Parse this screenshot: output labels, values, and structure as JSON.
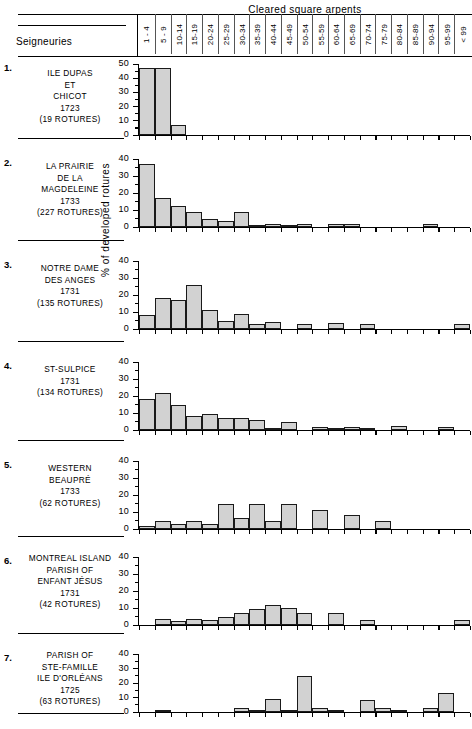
{
  "header": {
    "top_title": "Cleared square arpents",
    "row_label": "Seigneuries",
    "categories": [
      "1 - 4",
      "5 - 9",
      "10-14",
      "15-19",
      "20-24",
      "25-29",
      "30-34",
      "35-39",
      "40-44",
      "45-49",
      "50-54",
      "55-59",
      "60-64",
      "65-69",
      "70-74",
      "75-79",
      "80-84",
      "85-89",
      "90-94",
      "95-99",
      "< 99"
    ]
  },
  "axis": {
    "y_caption": "% of developed rotures",
    "ticks_50": [
      "50",
      "40",
      "30",
      "20",
      "10",
      "0"
    ],
    "ticks_40": [
      "40",
      "30",
      "20",
      "10",
      "0"
    ]
  },
  "chart_data": {
    "type": "bar",
    "title": "Cleared square arpents",
    "xlabel": "Cleared square arpents",
    "ylabel": "% of developed rotures",
    "grid": false,
    "legend": "none",
    "categories": [
      "1 - 4",
      "5 - 9",
      "10-14",
      "15-19",
      "20-24",
      "25-29",
      "30-34",
      "35-39",
      "40-44",
      "45-49",
      "50-54",
      "55-59",
      "60-64",
      "65-69",
      "70-74",
      "75-79",
      "80-84",
      "85-89",
      "90-94",
      "95-99",
      "< 99"
    ],
    "panels": [
      {
        "index": "1.",
        "name": [
          "ILE DUPAS",
          "ET",
          "CHICOT",
          "1723",
          "(19 ROTURES)"
        ],
        "seigneurie": "ILE DUPAS ET CHICOT",
        "year": "1723",
        "rotures": "(19 ROTURES)",
        "ylim": [
          0,
          50
        ],
        "yticks": [
          0,
          10,
          20,
          30,
          40,
          50
        ],
        "values": [
          47,
          47,
          7,
          0,
          0,
          0,
          0,
          0,
          0,
          0,
          0,
          0,
          0,
          0,
          0,
          0,
          0,
          0,
          0,
          0,
          0
        ]
      },
      {
        "index": "2.",
        "name": [
          "LA PRAIRIE",
          "DE LA",
          "MAGDELEINE",
          "1733",
          "(227 ROTURES)"
        ],
        "seigneurie": "LA PRAIRIE DE LA MAGDELEINE",
        "year": "1733",
        "rotures": "(227 ROTURES)",
        "ylim": [
          0,
          40
        ],
        "yticks": [
          0,
          10,
          20,
          30,
          40
        ],
        "values": [
          37,
          17,
          12.5,
          9,
          4.5,
          3.5,
          9,
          1,
          2,
          1,
          2,
          0,
          1.5,
          1.5,
          0,
          0,
          0,
          0,
          1.5,
          0,
          0
        ]
      },
      {
        "index": "3.",
        "name": [
          "NOTRE DAME",
          "DES ANGES",
          "1731",
          "(135 ROTURES)"
        ],
        "seigneurie": "NOTRE DAME DES ANGES",
        "year": "1731",
        "rotures": "(135 ROTURES)",
        "ylim": [
          0,
          40
        ],
        "yticks": [
          0,
          10,
          20,
          30,
          40
        ],
        "values": [
          8,
          18,
          17,
          26,
          11,
          5,
          9,
          3,
          4,
          0,
          3,
          0,
          3.5,
          0,
          3,
          0,
          0,
          0,
          0,
          0,
          3
        ]
      },
      {
        "index": "4.",
        "name": [
          "ST-SULPICE",
          "1731",
          "(134 ROTURES)"
        ],
        "seigneurie": "ST-SULPICE",
        "year": "1731",
        "rotures": "(134 ROTURES)",
        "ylim": [
          0,
          40
        ],
        "yticks": [
          0,
          10,
          20,
          30,
          40
        ],
        "values": [
          18,
          22,
          15,
          8.5,
          9.5,
          7,
          7,
          6,
          1,
          5,
          0,
          2,
          1,
          1.5,
          1,
          0,
          2.5,
          0,
          0,
          1.5,
          0
        ]
      },
      {
        "index": "5.",
        "name": [
          "WESTERN",
          "BEAUPRÉ",
          "1733",
          "(62 ROTURES)"
        ],
        "seigneurie": "WESTERN BEAUPRÉ",
        "year": "1733",
        "rotures": "(62 ROTURES)",
        "ylim": [
          0,
          40
        ],
        "yticks": [
          0,
          10,
          20,
          30,
          40
        ],
        "values": [
          1.5,
          5,
          3,
          5,
          3,
          15,
          6.5,
          15,
          5,
          15,
          0,
          11,
          0,
          8,
          0,
          5,
          0,
          0,
          0,
          0,
          0
        ]
      },
      {
        "index": "6.",
        "name": [
          "MONTREAL ISLAND",
          "PARISH OF",
          "ENFANT JÉSUS",
          "1731",
          "(42 ROTURES)"
        ],
        "seigneurie": "MONTREAL ISLAND PARISH OF ENFANT JÉSUS",
        "year": "1731",
        "rotures": "(42 ROTURES)",
        "ylim": [
          0,
          40
        ],
        "yticks": [
          0,
          10,
          20,
          30,
          40
        ],
        "values": [
          0,
          3.5,
          2.5,
          3.5,
          3,
          5,
          7,
          9.5,
          11.5,
          10,
          7,
          0,
          7,
          0,
          3,
          0,
          0,
          0,
          0,
          0,
          3
        ]
      },
      {
        "index": "7.",
        "name": [
          "PARISH OF",
          "STE-FAMILLE",
          "ILE D'ORLÉANS",
          "1725",
          "(63 ROTURES)"
        ],
        "seigneurie": "PARISH OF STE-FAMILLE ILE D'ORLÉANS",
        "year": "1725",
        "rotures": "(63 ROTURES)",
        "ylim": [
          0,
          40
        ],
        "yticks": [
          0,
          10,
          20,
          30,
          40
        ],
        "values": [
          0,
          1.5,
          0,
          0,
          0,
          0,
          3,
          1.5,
          9,
          1.5,
          25,
          3,
          1.5,
          0,
          8,
          3,
          1.5,
          0,
          3,
          13,
          0
        ]
      }
    ]
  }
}
